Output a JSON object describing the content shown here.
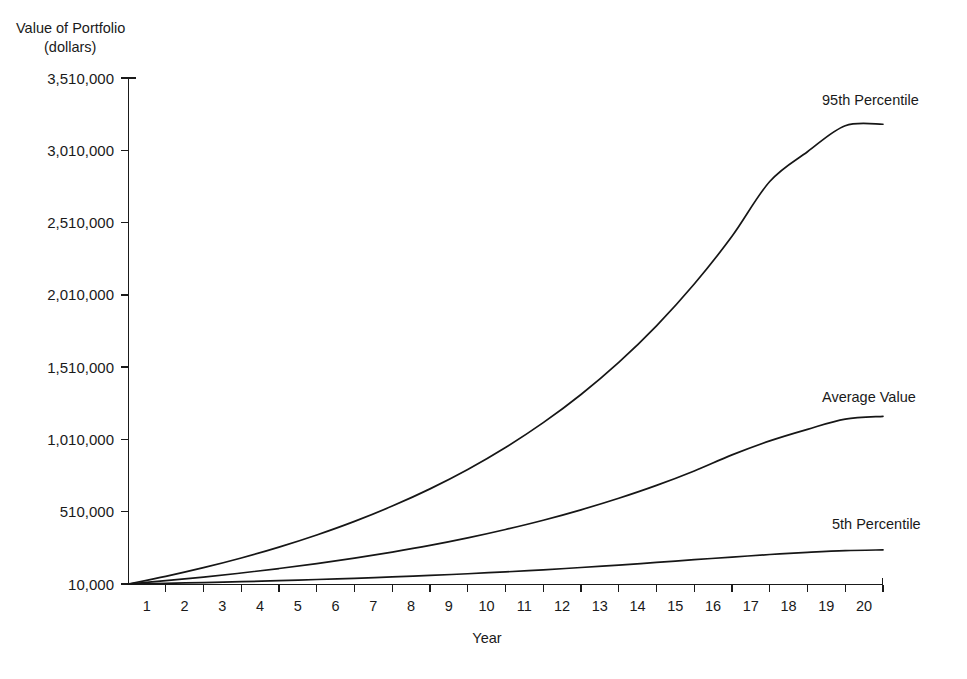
{
  "chart_data": {
    "type": "line",
    "title": "",
    "ylabel": "Value of Portfolio (dollars)",
    "ylabel_line1": "Value of Portfolio",
    "ylabel_line2": "(dollars)",
    "xlabel": "Year",
    "grid": false,
    "legend_position": "inline-right",
    "xlim": [
      0,
      20
    ],
    "ylim": [
      10000,
      3510000
    ],
    "ytick_labels": [
      "10,000",
      "510,000",
      "1,010,000",
      "1,510,000",
      "2,010,000",
      "2,510,000",
      "3,010,000",
      "3,510,000"
    ],
    "ytick_values": [
      10000,
      510000,
      1010000,
      1510000,
      2010000,
      2510000,
      3010000,
      3510000
    ],
    "xtick_labels": [
      "1",
      "2",
      "3",
      "4",
      "5",
      "6",
      "7",
      "8",
      "9",
      "10",
      "11",
      "12",
      "13",
      "14",
      "15",
      "16",
      "17",
      "18",
      "19",
      "20"
    ],
    "x": [
      0,
      1,
      2,
      3,
      4,
      5,
      6,
      7,
      8,
      9,
      10,
      11,
      12,
      13,
      14,
      15,
      16,
      17,
      18,
      19,
      20
    ],
    "series": [
      {
        "name": "95th Percentile",
        "label": "95th Percentile",
        "color": "#161616",
        "values": [
          10000,
          63000,
          123000,
          190000,
          265000,
          349000,
          443000,
          549000,
          668000,
          802000,
          954000,
          1126000,
          1321000,
          1543000,
          1796000,
          2085000,
          2415000,
          2794000,
          3000000,
          3180000,
          3190000
        ]
      },
      {
        "name": "Average Value",
        "label": "Average Value",
        "color": "#161616",
        "values": [
          10000,
          33000,
          58000,
          86000,
          117000,
          151000,
          189000,
          231000,
          277000,
          329000,
          387000,
          451000,
          523000,
          603000,
          692000,
          792000,
          903000,
          1000000,
          1080000,
          1150000,
          1170000
        ]
      },
      {
        "name": "5th Percentile",
        "label": "5th Percentile",
        "color": "#161616",
        "values": [
          10000,
          15000,
          20000,
          26000,
          33000,
          41000,
          49000,
          59000,
          69000,
          81000,
          94000,
          108000,
          124000,
          141000,
          159000,
          178000,
          196000,
          214000,
          229000,
          241000,
          246000
        ]
      }
    ]
  },
  "labels": {
    "series_95": "95th Percentile",
    "series_avg": "Average Value",
    "series_05": "5th Percentile",
    "y_title_line1": "Value of Portfolio",
    "y_title_line2": "(dollars)",
    "x_title": "Year"
  }
}
